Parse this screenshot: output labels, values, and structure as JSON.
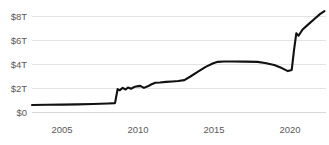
{
  "chart_data": {
    "type": "line",
    "title": "",
    "subtitle": "",
    "xlabel": "",
    "ylabel": "",
    "xlim": [
      2003,
      2022.3
    ],
    "ylim": [
      0,
      8.8
    ],
    "grid": true,
    "legend": "none",
    "y_unit": "trillions of US dollars",
    "y_tick_values": [
      0,
      2,
      4,
      6,
      8
    ],
    "y_tick_labels": [
      "$0",
      "$2T",
      "$4T",
      "$6T",
      "$8T"
    ],
    "x_tick_values": [
      2005,
      2010,
      2015,
      2020
    ],
    "x_tick_labels": [
      "2005",
      "2010",
      "2015",
      "2020"
    ],
    "line_color": "#111111",
    "grid_color": "#e3e3e3",
    "tick_text_color": "#5a5a5a",
    "background_color": "#ffffff",
    "series": [
      {
        "name": "Total assets",
        "color": "#111111",
        "x": [
          2003.0,
          2004.0,
          2005.0,
          2006.0,
          2007.0,
          2008.0,
          2008.45,
          2008.62,
          2008.75,
          2008.95,
          2009.15,
          2009.3,
          2009.5,
          2009.7,
          2009.9,
          2010.1,
          2010.35,
          2010.6,
          2010.85,
          2011.1,
          2011.4,
          2011.8,
          2012.2,
          2012.6,
          2013.0,
          2013.4,
          2013.9,
          2014.4,
          2014.9,
          2015.2,
          2015.6,
          2016.2,
          2017.0,
          2017.8,
          2018.3,
          2018.9,
          2019.4,
          2019.8,
          2020.05,
          2020.2,
          2020.35,
          2020.5,
          2020.75,
          2021.1,
          2021.5,
          2021.9,
          2022.2
        ],
        "y": [
          0.62,
          0.64,
          0.66,
          0.68,
          0.71,
          0.75,
          0.78,
          1.95,
          1.85,
          2.05,
          1.92,
          2.08,
          1.98,
          2.12,
          2.18,
          2.22,
          2.05,
          2.18,
          2.35,
          2.48,
          2.5,
          2.55,
          2.58,
          2.62,
          2.7,
          3.0,
          3.4,
          3.8,
          4.1,
          4.22,
          4.25,
          4.25,
          4.24,
          4.22,
          4.12,
          3.95,
          3.7,
          3.45,
          3.55,
          5.2,
          6.6,
          6.4,
          6.9,
          7.3,
          7.75,
          8.2,
          8.45
        ]
      }
    ]
  }
}
